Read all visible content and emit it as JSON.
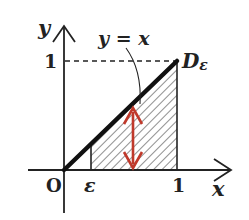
{
  "diagram": {
    "axis_labels": {
      "x": "x",
      "y": "y"
    },
    "origin_label": "O",
    "x_ticks": {
      "epsilon": "ε",
      "one": "1"
    },
    "y_ticks": {
      "one": "1"
    },
    "curve_label": "y = x",
    "region_label": "D",
    "region_subscript": "ε",
    "colors": {
      "ink": "#222222",
      "arrow": "#c0392b",
      "hatch": "#444444"
    },
    "region": {
      "description": "Triangle-like region between y=0 and y=x for epsilon ≤ x ≤ 1",
      "x_from": "ε",
      "x_to": 1
    }
  }
}
